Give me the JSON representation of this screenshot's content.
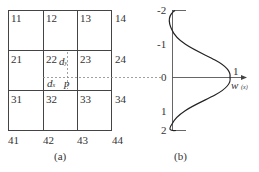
{
  "panel_a": {
    "caption": "(a)",
    "cells": [
      {
        "id": "11",
        "label": "11"
      },
      {
        "id": "12",
        "label": "12"
      },
      {
        "id": "13",
        "label": "13"
      },
      {
        "id": "14",
        "label": "14"
      },
      {
        "id": "21",
        "label": "21"
      },
      {
        "id": "22",
        "label": "22"
      },
      {
        "id": "23",
        "label": "23"
      },
      {
        "id": "24",
        "label": "24"
      },
      {
        "id": "31",
        "label": "31"
      },
      {
        "id": "32",
        "label": "32"
      },
      {
        "id": "33",
        "label": "33"
      },
      {
        "id": "34",
        "label": "34"
      },
      {
        "id": "41",
        "label": "41"
      },
      {
        "id": "42",
        "label": "42"
      },
      {
        "id": "43",
        "label": "43"
      },
      {
        "id": "44",
        "label": "44"
      }
    ],
    "annotations": {
      "dy_label": "d",
      "dy_sub": "y",
      "dx_label": "d",
      "dx_sub": "x",
      "point_label": "p"
    }
  },
  "panel_b": {
    "caption": "(b)",
    "axis_ticks": [
      "-2",
      "-1",
      "0",
      "1",
      "2"
    ],
    "peak_label": "1",
    "axis_label": "w",
    "axis_sub": "(x)"
  },
  "colors": {
    "line": "#444444",
    "dashed": "#777777",
    "curve": "#222222"
  }
}
